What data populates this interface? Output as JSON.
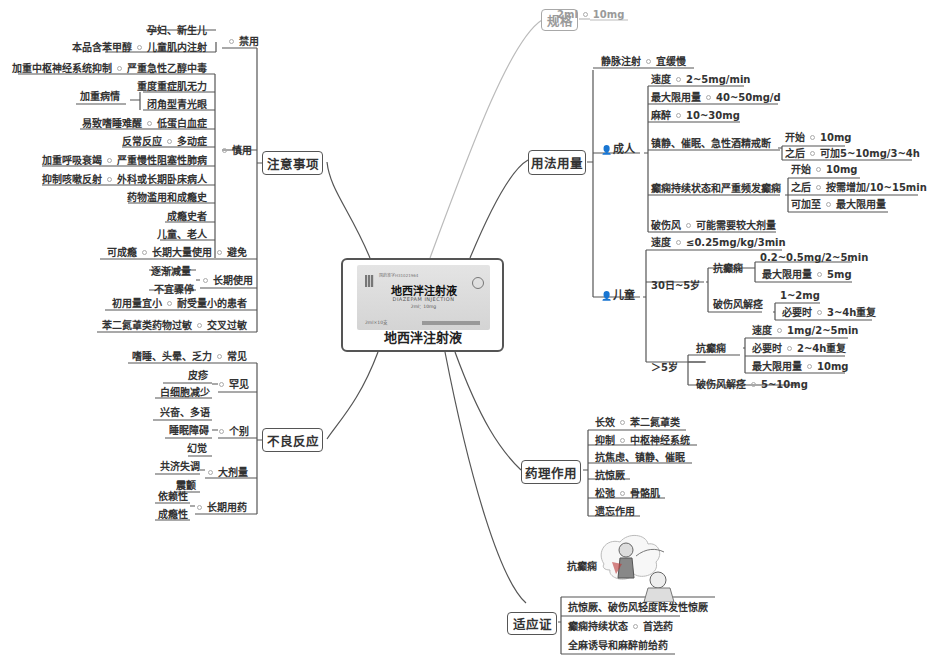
{
  "center": {
    "title": "地西泮注射液",
    "package": {
      "name": "地西泮注射液",
      "english": "DIAZEPAM INJECTION",
      "spec": "2ml：10mg",
      "box_count": "2ml×10支",
      "top_text": "国药准字H31021964"
    }
  },
  "spec": {
    "label": "规格",
    "value_a": "2ml",
    "value_b": "10mg"
  },
  "usage": {
    "label": "用法用量",
    "iv": {
      "label": "静脉注射",
      "value": "宜缓慢"
    },
    "adult": {
      "label": "成人",
      "items": [
        {
          "label": "速度",
          "value": "2~5mg/min"
        },
        {
          "label": "最大限用量",
          "value": "40~50mg/d"
        },
        {
          "label": "麻醉",
          "value": "10~30mg"
        },
        {
          "label": "镇静、催眠、急性酒精戒断",
          "children": [
            {
              "label": "开始",
              "value": "10mg"
            },
            {
              "label": "之后",
              "value": "可加5~10mg/3~4h"
            }
          ]
        },
        {
          "label": "癫痫持续状态和严重频发癫痫",
          "children": [
            {
              "label": "开始",
              "value": "10mg"
            },
            {
              "label": "之后",
              "value": "按需增加/10~15min"
            },
            {
              "label": "可加至",
              "value": "最大限用量"
            }
          ]
        },
        {
          "label": "破伤风",
          "value": "可能需要较大剂量"
        }
      ]
    },
    "child": {
      "label": "儿童",
      "speed": {
        "label": "速度",
        "value": "≤0.25mg/kg/3min"
      },
      "age_30d_5y": {
        "label": "30日~5岁",
        "epilepsy": {
          "label": "抗癫痫",
          "dose": "0.2~0.5mg/2~5min",
          "max_label": "最大限用量",
          "max_value": "5mg"
        },
        "tetanus": {
          "label": "破伤风解痉",
          "dose": "1~2mg",
          "repeat_label": "必要时",
          "repeat_value": "3~4h重复"
        }
      },
      "age_over_5y": {
        "label": "＞5岁",
        "epilepsy": {
          "label": "抗癫痫",
          "speed_label": "速度",
          "speed_value": "1mg/2~5min",
          "repeat_label": "必要时",
          "repeat_value": "2~4h重复",
          "max_label": "最大限用量",
          "max_value": "10mg"
        },
        "tetanus": {
          "label": "破伤风解痉",
          "value": "5~10mg"
        }
      }
    }
  },
  "pharmacology": {
    "label": "药理作用",
    "items": [
      {
        "label": "长效",
        "value": "苯二氮䓬类"
      },
      {
        "label": "抑制",
        "value": "中枢神经系统"
      },
      {
        "label": "抗焦虑、镇静、催眠"
      },
      {
        "label": "抗惊厥"
      },
      {
        "label": "松弛",
        "value": "骨骼肌"
      },
      {
        "label": "遗忘作用"
      }
    ]
  },
  "indications": {
    "label": "适应证",
    "image_label": "抗癫痫",
    "items": [
      {
        "label": "抗惊厥、破伤风轻度阵发性惊厥"
      },
      {
        "label": "癫痫持续状态",
        "value": "首选药"
      },
      {
        "label": "全麻诱导和麻醉前给药"
      }
    ]
  },
  "precautions": {
    "label": "注意事项",
    "contraindicated": {
      "label": "禁用",
      "items": [
        {
          "label": "孕妇、新生儿"
        },
        {
          "label": "儿童肌内注射",
          "reason": "本品含苯甲醇"
        }
      ]
    },
    "caution": {
      "label": "慎用",
      "items": [
        {
          "label": "严重急性乙醇中毒",
          "reason": "加重中枢神经系统抑制"
        },
        {
          "label": "重度重症肌无力"
        },
        {
          "label": "闭角型青光眼"
        },
        {
          "label": "低蛋白血症",
          "reason": "易致嗜睡难醒"
        },
        {
          "label": "多动症",
          "reason": "反常反应"
        },
        {
          "label": "严重慢性阻塞性肺病",
          "reason": "加重呼吸衰竭"
        },
        {
          "label": "外科或长期卧床病人",
          "reason": "抑制咳嗽反射"
        },
        {
          "label": "药物滥用和成瘾史"
        },
        {
          "label": "成瘾史者"
        },
        {
          "label": "儿童、老人"
        }
      ],
      "group_reason": "加重病情"
    },
    "avoid": {
      "label": "避免",
      "item": "长期大量使用",
      "reason": "可成瘾"
    },
    "long_term": {
      "label": "长期使用",
      "items": [
        "逐渐减量",
        "不宜骤停"
      ]
    },
    "low_tolerance": {
      "label": "耐受量小的患者",
      "value": "初用量宜小"
    },
    "cross_allergy": {
      "label": "交叉过敏",
      "value": "苯二氮䓬类药物过敏"
    }
  },
  "adverse": {
    "label": "不良反应",
    "common": {
      "label": "常见",
      "value": "嗜睡、头晕、乏力"
    },
    "rare": {
      "label": "罕见",
      "items": [
        "皮疹",
        "白细胞减少"
      ]
    },
    "individual": {
      "label": "个别",
      "items": [
        "兴奋、多语",
        "睡眠障碍",
        "幻觉"
      ]
    },
    "high_dose": {
      "label": "大剂量",
      "items": [
        "共济失调",
        "震颤"
      ]
    },
    "long_term": {
      "label": "长期用药",
      "items": [
        "依赖性",
        "成瘾性"
      ]
    }
  }
}
